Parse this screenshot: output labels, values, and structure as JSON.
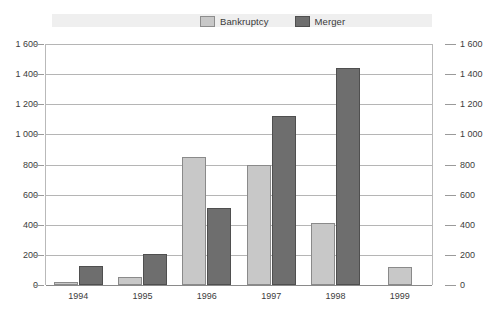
{
  "legend": {
    "entries": [
      {
        "label": "Bankruptcy",
        "color": "#c8c8c8",
        "icon": "legend-swatch-icon"
      },
      {
        "label": "Merger",
        "color": "#6e6e6e",
        "icon": "legend-swatch-icon"
      }
    ]
  },
  "axis": {
    "y_ticks": [
      "0",
      "200",
      "400",
      "600",
      "800",
      "1 000",
      "1 200",
      "1 400",
      "1 600"
    ],
    "y_ticks_right": [
      "0",
      "200",
      "400",
      "600",
      "800",
      "1 000",
      "1 200",
      "1 400",
      "1 600"
    ],
    "x_ticks": [
      "1994",
      "1995",
      "1996",
      "1997",
      "1998",
      "1999"
    ]
  },
  "chart_data": {
    "type": "bar",
    "title": "",
    "subtitle": "",
    "xlabel": "",
    "ylabel": "",
    "categories": [
      "1994",
      "1995",
      "1996",
      "1997",
      "1998",
      "1999"
    ],
    "series": [
      {
        "name": "Bankruptcy",
        "color": "#c8c8c8",
        "values": [
          20,
          50,
          850,
          795,
          415,
          120
        ]
      },
      {
        "name": "Merger",
        "color": "#6e6e6e",
        "values": [
          125,
          205,
          510,
          1120,
          1440,
          null
        ]
      }
    ],
    "ylim": [
      0,
      1600
    ],
    "ytick_step": 200,
    "ytick_labels": [
      "0",
      "200",
      "400",
      "600",
      "800",
      "1 000",
      "1 200",
      "1 400",
      "1 600"
    ],
    "grid": true,
    "dual_y_axis": true,
    "legend_position": "top-center"
  }
}
